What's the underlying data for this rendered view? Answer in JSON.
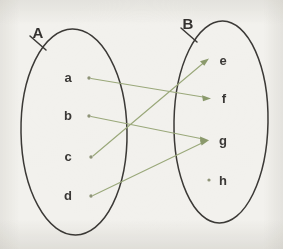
{
  "diagram": {
    "type": "set-mapping-diagram",
    "title": "",
    "background_color": "#f2f1ed",
    "ink_color": "#3b3936",
    "arrow_color": "#9aa87a",
    "sets": [
      {
        "id": "A",
        "label": "A",
        "label_x": 38,
        "label_y": 38,
        "tick": {
          "x1": 30,
          "y1": 36,
          "x2": 46,
          "y2": 50
        },
        "oval": {
          "cx": 74,
          "cy": 132,
          "rx": 53,
          "ry": 103
        },
        "elements": [
          {
            "id": "a",
            "label": "a",
            "label_x": 68,
            "label_y": 82,
            "dot_x": 89,
            "dot_y": 78
          },
          {
            "id": "b",
            "label": "b",
            "label_x": 68,
            "label_y": 120,
            "dot_x": 89,
            "dot_y": 116
          },
          {
            "id": "c",
            "label": "c",
            "label_x": 68,
            "label_y": 161,
            "dot_x": 91,
            "dot_y": 157
          },
          {
            "id": "d",
            "label": "d",
            "label_x": 68,
            "label_y": 200,
            "dot_x": 91,
            "dot_y": 196
          }
        ]
      },
      {
        "id": "B",
        "label": "B",
        "label_x": 188,
        "label_y": 29,
        "tick": {
          "x1": 181,
          "y1": 28,
          "x2": 197,
          "y2": 42
        },
        "oval": {
          "cx": 221,
          "cy": 122,
          "rx": 47,
          "ry": 101
        },
        "elements": [
          {
            "id": "e",
            "label": "e",
            "label_x": 219,
            "label_y": 65,
            "dot_x": 209,
            "dot_y": 60
          },
          {
            "id": "f",
            "label": "f",
            "label_x": 221,
            "label_y": 103,
            "dot_x": 211,
            "dot_y": 98
          },
          {
            "id": "g",
            "label": "g",
            "label_x": 219,
            "label_y": 145,
            "dot_x": 209,
            "dot_y": 140
          },
          {
            "id": "h",
            "label": "h",
            "label_x": 219,
            "label_y": 185,
            "dot_x": 209,
            "dot_y": 180
          }
        ]
      }
    ],
    "mappings": [
      {
        "id": "a-to-f",
        "from": "a",
        "to": "f",
        "x1": 89,
        "y1": 78,
        "x2": 209,
        "y2": 98
      },
      {
        "id": "b-to-g",
        "from": "b",
        "to": "g",
        "x1": 89,
        "y1": 116,
        "x2": 207,
        "y2": 140
      },
      {
        "id": "c-to-e",
        "from": "c",
        "to": "e",
        "x1": 91,
        "y1": 157,
        "x2": 207,
        "y2": 61
      },
      {
        "id": "d-to-g",
        "from": "d",
        "to": "g",
        "x1": 91,
        "y1": 196,
        "x2": 207,
        "y2": 142
      }
    ],
    "unmapped_targets": [
      "h"
    ]
  }
}
